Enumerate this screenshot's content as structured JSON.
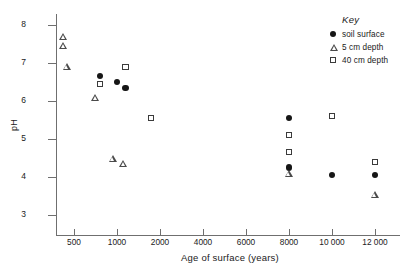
{
  "chart_data": {
    "type": "scatter",
    "title": "",
    "xlabel": "Age of surface (years)",
    "ylabel": "pH",
    "grid": false,
    "legend_position": "top-right",
    "legend_title": "Key",
    "xtick_labels": [
      "500",
      "1000",
      "2000",
      "4000",
      "6000",
      "8000",
      "10 000",
      "12 000"
    ],
    "xtick_values": [
      500,
      1000,
      2000,
      4000,
      6000,
      8000,
      10000,
      12000
    ],
    "ytick_labels": [
      "3",
      "4",
      "5",
      "6",
      "7",
      "8"
    ],
    "ylim": [
      3,
      8
    ],
    "series": [
      {
        "name": "soil surface",
        "marker": "filled-circle",
        "color": "#161616",
        "points": [
          {
            "x": 800,
            "y": 6.65
          },
          {
            "x": 1000,
            "y": 6.5
          },
          {
            "x": 1200,
            "y": 6.35
          },
          {
            "x": 8000,
            "y": 5.55
          },
          {
            "x": 8000,
            "y": 4.25
          },
          {
            "x": 10000,
            "y": 4.05
          },
          {
            "x": 12000,
            "y": 4.05
          }
        ]
      },
      {
        "name": "5 cm depth",
        "marker": "open-triangle",
        "color": "#4a4a4a",
        "points": [
          {
            "x": 200,
            "y": 7.7
          },
          {
            "x": 200,
            "y": 7.45
          },
          {
            "x": 300,
            "y": 6.9
          },
          {
            "x": 750,
            "y": 6.1
          },
          {
            "x": 950,
            "y": 4.5
          },
          {
            "x": 1150,
            "y": 4.35
          },
          {
            "x": 8000,
            "y": 4.1
          },
          {
            "x": 12000,
            "y": 3.55
          }
        ]
      },
      {
        "name": "40 cm depth",
        "marker": "open-square",
        "color": "#3b3b3b",
        "points": [
          {
            "x": 800,
            "y": 6.45
          },
          {
            "x": 1200,
            "y": 6.9
          },
          {
            "x": 1800,
            "y": 5.55
          },
          {
            "x": 8000,
            "y": 5.1
          },
          {
            "x": 8000,
            "y": 4.65
          },
          {
            "x": 10000,
            "y": 5.6
          },
          {
            "x": 12000,
            "y": 4.4
          }
        ]
      }
    ]
  },
  "legend": {
    "title": "Key",
    "entries": [
      {
        "label": "soil surface",
        "marker": "filled-circle"
      },
      {
        "label": "5 cm depth",
        "marker": "open-triangle"
      },
      {
        "label": "40 cm depth",
        "marker": "open-square"
      }
    ]
  }
}
